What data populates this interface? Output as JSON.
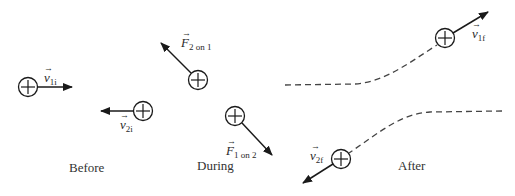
{
  "diagram": {
    "type": "collision-sequence",
    "stroke_color": "#1a1a1a",
    "dash_color": "#444444",
    "panels": [
      {
        "caption": "Before"
      },
      {
        "caption": "During"
      },
      {
        "caption": "After"
      }
    ],
    "particles": [
      {
        "id": "p1-before",
        "symbol": "+",
        "vector": {
          "base": "v",
          "sub": "1i"
        }
      },
      {
        "id": "p2-before",
        "symbol": "+",
        "vector": {
          "base": "v",
          "sub": "2i"
        }
      },
      {
        "id": "p1-during",
        "symbol": "+",
        "vector": {
          "base": "F",
          "sub": "2 on 1"
        }
      },
      {
        "id": "p2-during",
        "symbol": "+",
        "vector": {
          "base": "F",
          "sub": "1 on 2"
        }
      },
      {
        "id": "p1-after",
        "symbol": "+",
        "vector": {
          "base": "v",
          "sub": "1f"
        }
      },
      {
        "id": "p2-after",
        "symbol": "+",
        "vector": {
          "base": "v",
          "sub": "2f"
        }
      }
    ],
    "arrow_glyph": "→"
  }
}
